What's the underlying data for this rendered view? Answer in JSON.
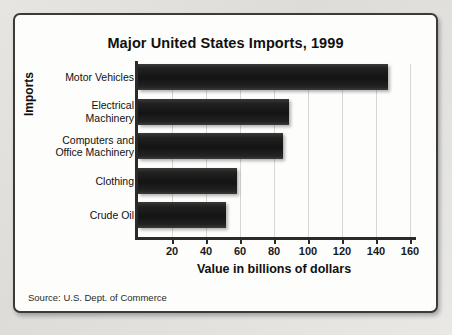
{
  "figure": {
    "title": "Major United States Imports, 1999",
    "source_note": "Source: U.S. Dept. of Commerce"
  },
  "chart_data": {
    "type": "bar",
    "orientation": "horizontal",
    "title": "Major United States Imports, 1999",
    "xlabel": "Value in billions of dollars",
    "ylabel": "Imports",
    "categories": [
      "Motor Vehicles",
      "Electrical Machinery",
      "Computers and Office Machinery",
      "Clothing",
      "Crude Oil"
    ],
    "category_lines": [
      [
        "Motor Vehicles"
      ],
      [
        "Electrical",
        "Machinery"
      ],
      [
        "Computers and",
        "Office Machinery"
      ],
      [
        "Clothing"
      ],
      [
        "Crude Oil"
      ]
    ],
    "values": [
      147,
      89,
      85,
      58,
      52
    ],
    "xlim": [
      0,
      172
    ],
    "xticks": [
      20,
      40,
      60,
      80,
      100,
      120,
      140,
      160
    ],
    "xtick_labels": [
      "20",
      "40",
      "60",
      "80",
      "100",
      "120",
      "140",
      "160"
    ],
    "grid": "vertical-light",
    "legend": "none",
    "bar_color": "#1a1a1a",
    "units": "billions of dollars"
  }
}
